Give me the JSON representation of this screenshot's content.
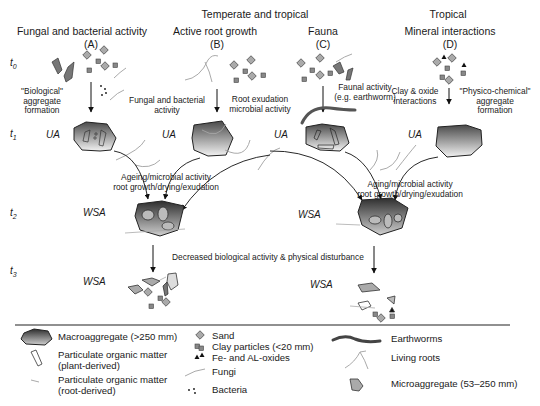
{
  "regions": {
    "temperate": "Temperate and tropical",
    "tropical": "Tropical"
  },
  "columns": [
    {
      "title": "Fungal and bacterial activity",
      "letter": "(A)"
    },
    {
      "title": "Active root growth",
      "letter": "(B)"
    },
    {
      "title": "Fauna",
      "letter": "(C)"
    },
    {
      "title": "Mineral interactions",
      "letter": "(D)"
    }
  ],
  "time_labels": [
    "t0",
    "t1",
    "t2",
    "t3"
  ],
  "process_labels": {
    "biological_formation": [
      "\"Biological\"",
      "aggregate",
      "formation"
    ],
    "fungal_bacterial": [
      "Fungal and bacterial",
      "activity"
    ],
    "root_exudation": [
      "Root exudation",
      "microbial activity"
    ],
    "faunal_activity": [
      "Faunal activity",
      "(e.g. earthworm)"
    ],
    "clay_oxide": [
      "Clay & oxide",
      "interactions"
    ],
    "physico_chemical": [
      "\"Physico-chemical\"",
      "aggregate",
      "formation"
    ],
    "ageing_left": [
      "Ageing/microbial activity",
      "root growth/drying/exudation"
    ],
    "ageing_right": [
      "Aging/microbial activity",
      "root growth/drying/exudation"
    ],
    "decreased": "Decreased biological activity & physical disturbance"
  },
  "aggregate_labels": {
    "ua": "UA",
    "wsa": "WSA"
  },
  "legend": {
    "macroaggregate": "Macroaggregate (>250 mm)",
    "pom_plant": [
      "Particulate organic matter",
      "(plant-derived)"
    ],
    "pom_root": [
      "Particulate organic matter",
      "(root-derived)"
    ],
    "sand": "Sand",
    "clay": "Clay particles (<20 mm)",
    "oxides": "Fe- and AL-oxides",
    "fungi": "Fungi",
    "bacteria": "Bacteria",
    "earthworms": "Earthworms",
    "living_roots": "Living roots",
    "microaggregate": "Microaggregate (53–250 mm)"
  }
}
